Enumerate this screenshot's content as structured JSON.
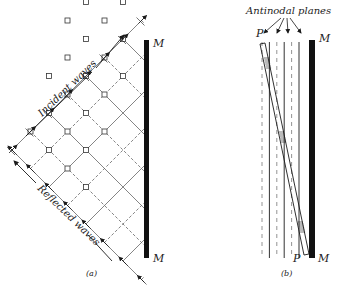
{
  "figure": {
    "panel_a": {
      "caption": "(a)",
      "mirror_top_label": "M",
      "mirror_bottom_label": "M",
      "incident_label": "Incident waves",
      "reflected_label": "Reflected waves"
    },
    "panel_b": {
      "caption": "(b)",
      "title": "Antinodal planes",
      "plate_top_label": "P",
      "plate_bottom_label": "P",
      "mirror_top_label": "M",
      "mirror_bottom_label": "M"
    },
    "colors": {
      "ink": "#1a1a1a",
      "line": "#555555",
      "background": "#ffffff"
    }
  }
}
